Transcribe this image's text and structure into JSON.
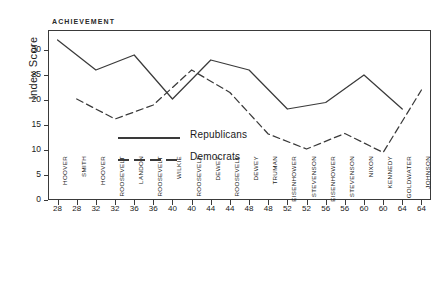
{
  "chart_data": {
    "type": "line",
    "title": "ACHIEVEMENT",
    "xlabel": "",
    "ylabel": "Index Score",
    "ylim": [
      0,
      34
    ],
    "yticks": [
      0,
      5,
      10,
      15,
      20,
      25,
      30
    ],
    "grid": false,
    "legend_position": "center-left",
    "x_positions": [
      1,
      2,
      3,
      4,
      5,
      6,
      7,
      8,
      9,
      10,
      11,
      12,
      13,
      14,
      15,
      16,
      17,
      18,
      19,
      20
    ],
    "year_labels": [
      "28",
      "28",
      "32",
      "32",
      "36",
      "36",
      "40",
      "40",
      "44",
      "44",
      "48",
      "48",
      "52",
      "52",
      "56",
      "56",
      "60",
      "60",
      "64",
      "64"
    ],
    "candidate_labels": [
      "HOOVER",
      "SMITH",
      "HOOVER",
      "ROOSEVELT",
      "LANDON",
      "ROOSEVELT",
      "WILKIE",
      "ROOSEVELT",
      "DEWEY",
      "ROOSEVELT",
      "DEWEY",
      "TRUMAN",
      "EISENHOWER",
      "STEVENSON",
      "EISENHOWER",
      "STEVENSON",
      "NIXON",
      "KENNEDY",
      "GOLDWATER",
      "JOHNSON"
    ],
    "series": [
      {
        "name": "Republicans",
        "style": "solid",
        "color": "#3a3a3a",
        "x_positions": [
          1,
          3,
          5,
          7,
          9,
          11,
          13,
          15,
          17,
          19
        ],
        "candidates": [
          "HOOVER",
          "HOOVER",
          "LANDON",
          "WILKIE",
          "DEWEY",
          "DEWEY",
          "EISENHOWER",
          "EISENHOWER",
          "NIXON",
          "GOLDWATER"
        ],
        "years": [
          "28",
          "32",
          "36",
          "40",
          "44",
          "48",
          "52",
          "56",
          "60",
          "64"
        ],
        "values": [
          32,
          26,
          29,
          20.2,
          28,
          26,
          18.2,
          19.5,
          25,
          18.2
        ]
      },
      {
        "name": "Democrats",
        "style": "dashed",
        "color": "#3a3a3a",
        "x_positions": [
          2,
          4,
          6,
          8,
          10,
          12,
          14,
          16,
          18,
          20
        ],
        "candidates": [
          "SMITH",
          "ROOSEVELT",
          "ROOSEVELT",
          "ROOSEVELT",
          "ROOSEVELT",
          "TRUMAN",
          "STEVENSON",
          "STEVENSON",
          "KENNEDY",
          "JOHNSON"
        ],
        "years": [
          "28",
          "32",
          "36",
          "40",
          "44",
          "48",
          "52",
          "56",
          "60",
          "64"
        ],
        "values": [
          20.2,
          16.2,
          19,
          26,
          21.5,
          13.2,
          10.2,
          13.3,
          9.5,
          22
        ]
      }
    ]
  },
  "legend": {
    "items": [
      {
        "label": "Republicans",
        "style": "solid"
      },
      {
        "label": "Democrats",
        "style": "dashed"
      }
    ]
  }
}
